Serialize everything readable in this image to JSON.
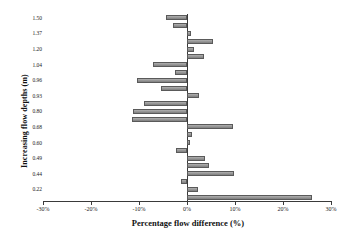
{
  "chart_data": {
    "type": "bar",
    "orientation": "horizontal",
    "title": "",
    "xlabel": "Percentage flow difference (%)",
    "ylabel": "Increasing flow depths (m)",
    "xlim": [
      -30,
      30
    ],
    "xticks": [
      -30,
      -20,
      -10,
      0,
      10,
      20,
      30
    ],
    "xticklabels": [
      "-30%",
      "-20%",
      "-10%",
      "0%",
      "10%",
      "20%",
      "30%"
    ],
    "grid": false,
    "legend": null,
    "ytick_positions": [
      0,
      2,
      4,
      6,
      8,
      10,
      12,
      14,
      16,
      18,
      20,
      22
    ],
    "yticklabels": [
      "1.50",
      "1.37",
      "1.20",
      "1.04",
      "0.96",
      "0.93",
      "0.80",
      "0.68",
      "0.60",
      "0.49",
      "0.44",
      "0.22"
    ],
    "categories": [
      "1.50",
      "",
      "1.37",
      "",
      "1.20",
      "",
      "1.04",
      "",
      "0.96",
      "",
      "0.93",
      "",
      "0.80",
      "",
      "0.68",
      "",
      "0.60",
      "",
      "0.49",
      "",
      "0.44",
      "",
      "0.22",
      ""
    ],
    "values": [
      -4.4,
      -3.0,
      0.9,
      5.4,
      1.4,
      3.5,
      -7.1,
      -2.6,
      -10.5,
      -5.5,
      2.6,
      -9.0,
      -11.2,
      -11.4,
      9.6,
      1.0,
      0.7,
      -2.2,
      3.7,
      4.5,
      9.8,
      -1.2,
      2.3,
      26.0
    ],
    "value_unit": "%",
    "bar_color": "#8d8d8d",
    "bar_edge_color": "#5a5a5a",
    "axis_color": "#3a3a3a"
  }
}
